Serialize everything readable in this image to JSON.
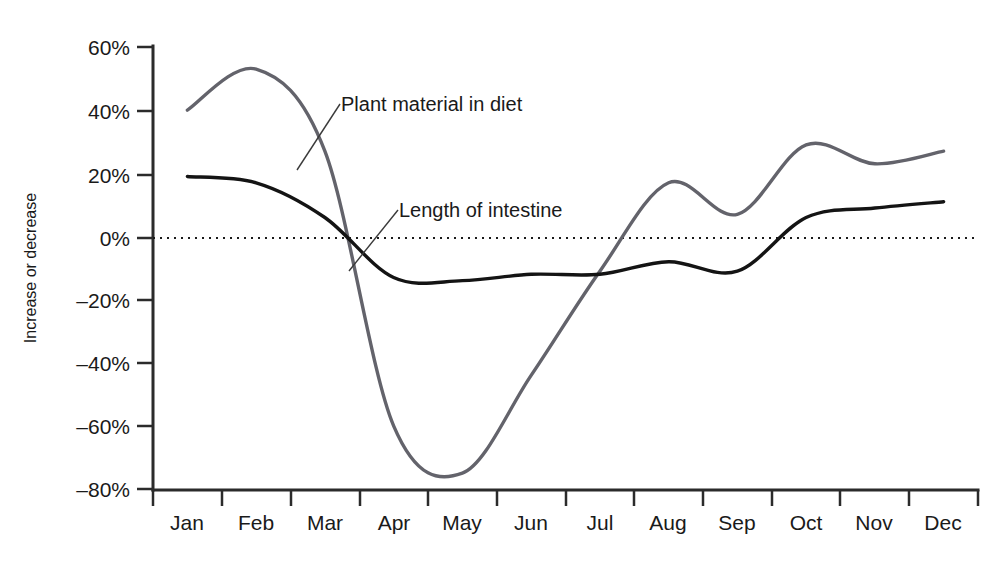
{
  "chart_data": {
    "type": "line",
    "title": "",
    "xlabel": "",
    "ylabel": "Increase or decrease",
    "grid": false,
    "legend_position": "inline-annotations",
    "ylim": [
      -80,
      60
    ],
    "y_ticks": [
      "60%",
      "40%",
      "20%",
      "0%",
      "–20%",
      "–40%",
      "–60%",
      "–80%"
    ],
    "y_tick_values": [
      60,
      40,
      20,
      0,
      -20,
      -40,
      -60,
      -80
    ],
    "categories": [
      "Jan",
      "Feb",
      "Mar",
      "Apr",
      "May",
      "Jun",
      "Jul",
      "Aug",
      "Sep",
      "Oct",
      "Nov",
      "Dec"
    ],
    "zero_reference_line": 0,
    "series": [
      {
        "name": "Plant material in diet",
        "color": "#63636b",
        "values": [
          40,
          53,
          27,
          -60,
          -75,
          -44,
          -11,
          17,
          7,
          29,
          23,
          27
        ],
        "annotation": {
          "text": "Plant material in diet",
          "anchor_month": "Mar",
          "anchor_value": 20
        }
      },
      {
        "name": "Length of intestine",
        "color": "#141414",
        "values": [
          19,
          17,
          6,
          -13,
          -14,
          -12,
          -12,
          -8,
          -11,
          6,
          9,
          11
        ],
        "annotation": {
          "text": "Length of intestine",
          "anchor_month": "Apr",
          "anchor_value": -12
        }
      }
    ]
  },
  "axis": {
    "y_title": "Increase or decrease"
  },
  "annotations": {
    "plant": "Plant material in diet",
    "intestine": "Length of intestine"
  },
  "y_labels": {
    "t0": "60%",
    "t1": "40%",
    "t2": "20%",
    "t3": "0%",
    "t4": "–20%",
    "t5": "–40%",
    "t6": "–60%",
    "t7": "–80%"
  },
  "x_labels": {
    "m0": "Jan",
    "m1": "Feb",
    "m2": "Mar",
    "m3": "Apr",
    "m4": "May",
    "m5": "Jun",
    "m6": "Jul",
    "m7": "Aug",
    "m8": "Sep",
    "m9": "Oct",
    "m10": "Nov",
    "m11": "Dec"
  },
  "colors": {
    "plant_series": "#63636b",
    "intestine_series": "#141414",
    "axis": "#2b2b2b",
    "background": "#ffffff"
  }
}
